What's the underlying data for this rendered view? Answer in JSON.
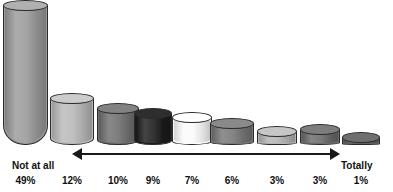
{
  "chart_data": {
    "type": "bar",
    "title": "",
    "subtitle": "",
    "xlabel": "",
    "ylabel": "",
    "grid": false,
    "legend": "none",
    "axis_note": "3-D cylinder bars, descending; horizontal double-headed scale arrow beneath bars",
    "scale_left_label": "Not at all",
    "scale_right_label": "Totally",
    "categories": [
      "1",
      "2",
      "3",
      "4",
      "5",
      "6",
      "7",
      "8",
      "9"
    ],
    "values": [
      49,
      12,
      10,
      9,
      7,
      6,
      3,
      3,
      1
    ],
    "ylim": [
      0,
      52
    ],
    "data_labels": [
      "49%",
      "12%",
      "10%",
      "9%",
      "7%",
      "6%",
      "3%",
      "3%",
      "1%"
    ],
    "bars": [
      {
        "label": "49%",
        "value": 49,
        "color": "#9a9a9a",
        "cap_color": "#b0b0b0"
      },
      {
        "label": "12%",
        "value": 12,
        "color": "#b9b9b9",
        "cap_color": "#cccccc"
      },
      {
        "label": "10%",
        "value": 10,
        "color": "#6e6e6e",
        "cap_color": "#828282"
      },
      {
        "label": "9%",
        "value": 9,
        "color": "#1c1c1c",
        "cap_color": "#2e2e2e"
      },
      {
        "label": "7%",
        "value": 7,
        "color": "#fbfbfb",
        "cap_color": "#ffffff"
      },
      {
        "label": "6%",
        "value": 6,
        "color": "#777777",
        "cap_color": "#8a8a8a"
      },
      {
        "label": "3%",
        "value": 3,
        "color": "#b4b4b4",
        "cap_color": "#c6c6c6"
      },
      {
        "label": "3%",
        "value": 3,
        "color": "#6b6b6b",
        "cap_color": "#7d7d7d"
      },
      {
        "label": "1%",
        "value": 1,
        "color": "#5e5e5e",
        "cap_color": "#6f6f6f"
      }
    ],
    "colors": {
      "background": "#ffffff",
      "outline": "#2b2b2b",
      "arrow": "#1a1a1a",
      "text": "#111111"
    }
  }
}
